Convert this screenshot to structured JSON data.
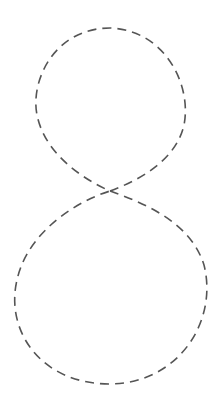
{
  "canvas": {
    "width": 221,
    "height": 411,
    "background": "#ffffff"
  },
  "figure": {
    "shape": "figure-eight",
    "stroke_color": "#555555",
    "stroke_width": 1.6,
    "dash_pattern": "9 6",
    "crossing_point": [
      110,
      191
    ],
    "upper_loop": {
      "center": [
        111,
        105
      ],
      "rx": 75,
      "ry": 77
    },
    "lower_loop": {
      "center": [
        111,
        288
      ],
      "rx": 96,
      "ry": 96
    }
  }
}
